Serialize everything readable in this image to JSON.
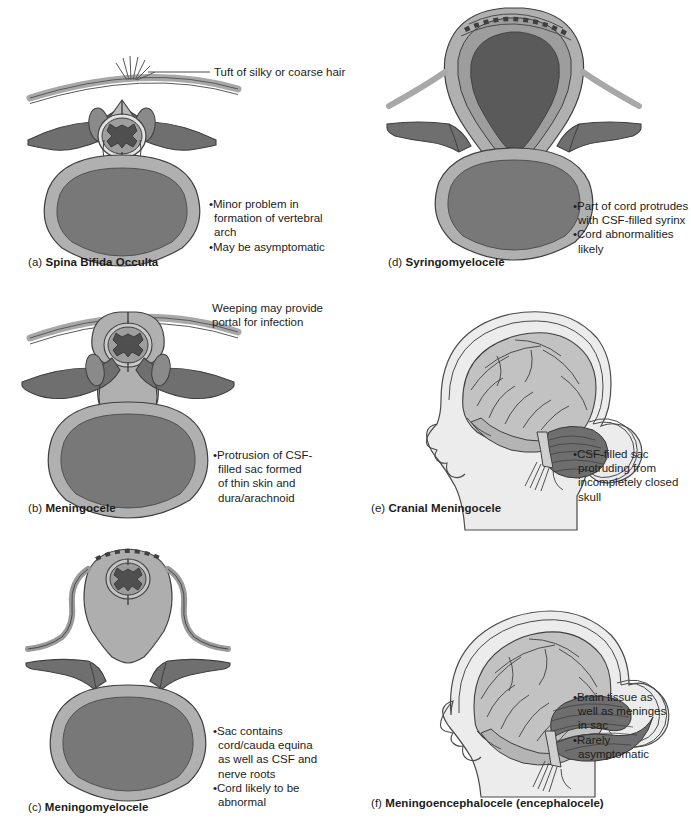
{
  "figure": {
    "columns": 2,
    "rows": 3
  },
  "palette": {
    "background": "#ffffff",
    "skin_light": "#ebebeb",
    "sac_fill": "#b0b0b0",
    "bone_light": "#b9b9b9",
    "bone_mid": "#8f8f8f",
    "bone_dark": "#6f6f6f",
    "cord_dark": "#585858",
    "body_inner": "#787878",
    "brain_fill": "#c2c2c2",
    "cerebellum": "#707070",
    "outline": "#4a4a4a",
    "text": "#1c1c1c"
  },
  "panels": [
    {
      "id": "a",
      "index": "(a)",
      "title": "Spina Bifida Occulta",
      "kind": "vertebra-cross-section",
      "callout": {
        "text": "Tuft of silky or coarse hair",
        "leader": "horizontal-line-to-hair-tuft"
      },
      "bullets": [
        {
          "lines": [
            "•Minor problem in",
            "formation of vertebral",
            "arch"
          ]
        },
        {
          "lines": [
            "•May be asymptomatic"
          ]
        }
      ]
    },
    {
      "id": "d",
      "index": "(d)",
      "title": "Syringomyelocele",
      "kind": "vertebra-cross-section",
      "callout": null,
      "bullets": [
        {
          "lines": [
            "•Part of cord protrudes",
            "with CSF-filled syrinx"
          ]
        },
        {
          "lines": [
            "•Cord abnormalities",
            "likely"
          ]
        }
      ]
    },
    {
      "id": "b",
      "index": "(b)",
      "title": "Meningocele",
      "kind": "vertebra-cross-section",
      "callout": {
        "text": "Weeping may provide\nportal for infection",
        "lines": [
          "Weeping may provide",
          "portal for infection"
        ],
        "leader": "none"
      },
      "bullets": [
        {
          "lines": [
            "•Protrusion of CSF-",
            "filled sac formed",
            "of thin skin and",
            "dura/arachnoid"
          ]
        }
      ]
    },
    {
      "id": "e",
      "index": "(e)",
      "title": "Cranial Meningocele",
      "kind": "head-sagittal",
      "callout": null,
      "bullets": [
        {
          "lines": [
            "•CSF-filled sac",
            "protruding from",
            "incompletely closed",
            "skull"
          ]
        }
      ]
    },
    {
      "id": "c",
      "index": "(c)",
      "title": "Meningomyelocele",
      "kind": "vertebra-cross-section",
      "callout": null,
      "bullets": [
        {
          "lines": [
            "•Sac contains",
            "cord/cauda equina",
            "as well as CSF and",
            "nerve roots"
          ]
        },
        {
          "lines": [
            "•Cord likely to be",
            "abnormal"
          ]
        }
      ]
    },
    {
      "id": "f",
      "index": "(f)",
      "title": "Meningoencephalocele (encephalocele)",
      "kind": "head-sagittal",
      "callout": null,
      "bullets": [
        {
          "lines": [
            "•Brain tissue as",
            "well as meninges",
            "in sac"
          ]
        },
        {
          "lines": [
            "•Rarely",
            "asymptomatic"
          ]
        }
      ]
    }
  ]
}
